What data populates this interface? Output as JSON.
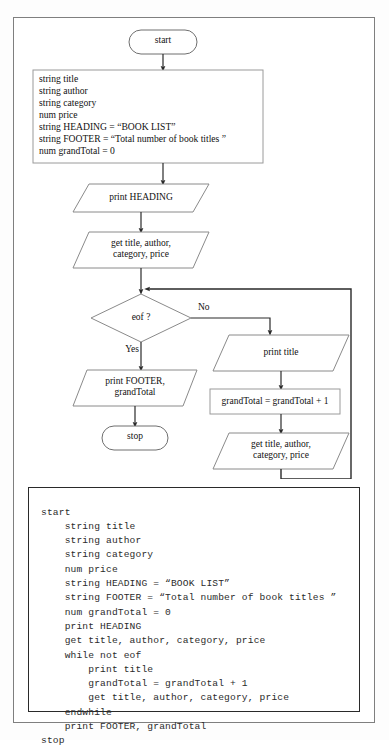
{
  "document": {
    "title": "Book list flowchart and pseudocode",
    "colors": {
      "page_border": "#7f7f7f",
      "shape_stroke": "#6f6f6f",
      "connector": "#2a2a2a",
      "text": "#111111",
      "code_text": "#2b2b2b",
      "code_border": "#2a2a2a",
      "background": "#ffffff"
    }
  },
  "flowchart": {
    "type": "flowchart",
    "nodes": [
      {
        "id": "start",
        "shape": "terminator",
        "label": "start"
      },
      {
        "id": "declarations",
        "shape": "process",
        "label": "string title\nstring author\nstring category\nnum price\nstring HEADING = “BOOK LIST”\nstring FOOTER = “Total number of book titles ”\nnum grandTotal = 0"
      },
      {
        "id": "print-heading",
        "shape": "io",
        "label": "print HEADING"
      },
      {
        "id": "get-record-1",
        "shape": "io",
        "label": "get title, author,\ncategory, price"
      },
      {
        "id": "eof",
        "shape": "decision",
        "label": "eof ?"
      },
      {
        "id": "print-footer",
        "shape": "io",
        "label": "print FOOTER,\ngrandTotal"
      },
      {
        "id": "stop",
        "shape": "terminator",
        "label": "stop"
      },
      {
        "id": "print-title",
        "shape": "io",
        "label": "print title"
      },
      {
        "id": "increment",
        "shape": "process",
        "label": "grandTotal = grandTotal + 1"
      },
      {
        "id": "get-record-2",
        "shape": "io",
        "label": "get title, author,\ncategory, price"
      }
    ],
    "branch_labels": {
      "yes": "Yes",
      "no": "No"
    },
    "declaration_lines": [
      "string title",
      "string author",
      "string category",
      "num price",
      "string HEADING = “BOOK LIST”",
      "string FOOTER = “Total number of book titles ”",
      "num grandTotal = 0"
    ]
  },
  "pseudocode": {
    "text": "start\n    string title\n    string author\n    string category\n    num price\n    string HEADING = “BOOK LIST”\n    string FOOTER = “Total number of book titles ”\n    num grandTotal = 0\n    print HEADING\n    get title, author, category, price\n    while not eof\n        print title\n        grandTotal = grandTotal + 1\n        get title, author, category, price\n    endwhile\n    print FOOTER, grandTotal\nstop",
    "lines": [
      "start",
      "    string title",
      "    string author",
      "    string category",
      "    num price",
      "    string HEADING = “BOOK LIST”",
      "    string FOOTER = “Total number of book titles ”",
      "    num grandTotal = 0",
      "    print HEADING",
      "    get title, author, category, price",
      "    while not eof",
      "        print title",
      "        grandTotal = grandTotal + 1",
      "        get title, author, category, price",
      "    endwhile",
      "    print FOOTER, grandTotal",
      "stop"
    ]
  }
}
